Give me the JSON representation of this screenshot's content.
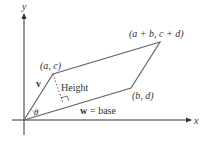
{
  "diagram": {
    "type": "parallelogram-area",
    "axes": {
      "x_label": "x",
      "y_label": "y"
    },
    "vertices": {
      "origin": "",
      "v_tip": "(a, c)",
      "sum": "(a + b, c + d)",
      "w_tip": "(b, d)"
    },
    "labels": {
      "v": "v",
      "height": "Height",
      "w_base": "w = base",
      "w": "w",
      "base_eq": "= base",
      "theta": "θ"
    },
    "colors": {
      "axis": "#333333",
      "edges": "#666666",
      "text": "#333333"
    }
  }
}
